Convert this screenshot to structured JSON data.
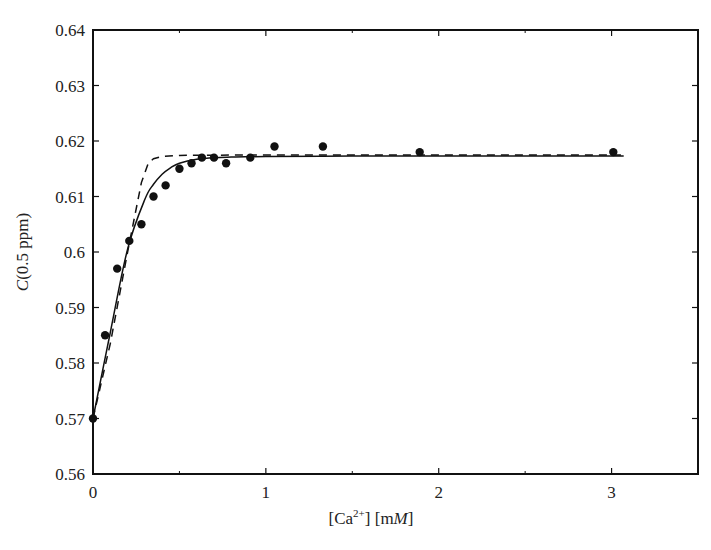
{
  "chart_data": {
    "type": "scatter",
    "title": "",
    "xlabel": "[Ca2+] [mM]",
    "xlabel_parts": {
      "pre": "[Ca",
      "sup": "2+",
      "mid": "] [m",
      "ital": "M",
      "post": "]"
    },
    "ylabel": "C(0.5 ppm)",
    "ylabel_parts": {
      "ital": "C",
      "rest": "(0.5 ppm)"
    },
    "xlim": [
      0,
      3.5
    ],
    "ylim": [
      0.56,
      0.64
    ],
    "x_ticks": [
      0,
      1,
      2,
      3
    ],
    "x_tick_labels": [
      "0",
      "1",
      "2",
      "3"
    ],
    "x_minor_ticks": [
      0.5,
      1.5,
      2.5
    ],
    "y_ticks": [
      0.56,
      0.57,
      0.58,
      0.59,
      0.6,
      0.61,
      0.62,
      0.63,
      0.64
    ],
    "y_tick_labels": [
      "0.56",
      "0.57",
      "0.58",
      "0.59",
      "0.6",
      "0.61",
      "0.62",
      "0.63",
      "0.64"
    ],
    "grid": false,
    "legend": null,
    "series": [
      {
        "name": "measured",
        "style": "points",
        "x": [
          0,
          0.07,
          0.14,
          0.21,
          0.28,
          0.35,
          0.42,
          0.5,
          0.57,
          0.63,
          0.7,
          0.77,
          0.91,
          1.05,
          1.33,
          1.89,
          3.01
        ],
        "y": [
          0.57,
          0.585,
          0.597,
          0.602,
          0.605,
          0.61,
          0.612,
          0.615,
          0.616,
          0.617,
          0.617,
          0.616,
          0.617,
          0.619,
          0.619,
          0.618,
          0.618
        ]
      },
      {
        "name": "fit (solid)",
        "style": "solid-line",
        "x": [
          0,
          0.1,
          0.2,
          0.3,
          0.35,
          0.4,
          0.45,
          0.5,
          0.6,
          0.7,
          0.8,
          1.0,
          1.5,
          2.0,
          2.5,
          3.07
        ],
        "y": [
          0.57,
          0.5855,
          0.6005,
          0.6095,
          0.6122,
          0.614,
          0.6152,
          0.616,
          0.6167,
          0.617,
          0.6171,
          0.6172,
          0.6173,
          0.6173,
          0.6173,
          0.6173
        ]
      },
      {
        "name": "fit (dashed)",
        "style": "dashed-line",
        "x": [
          0,
          0.1,
          0.2,
          0.28,
          0.32,
          0.35,
          0.4,
          0.5,
          1.0,
          2.0,
          3.07
        ],
        "y": [
          0.57,
          0.5835,
          0.6,
          0.6125,
          0.616,
          0.6168,
          0.6172,
          0.6174,
          0.6175,
          0.6175,
          0.6175
        ]
      }
    ]
  }
}
